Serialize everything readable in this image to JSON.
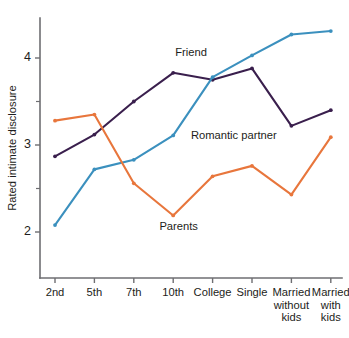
{
  "chart_data": {
    "type": "line",
    "title": "",
    "xlabel": "",
    "ylabel": "Rated intimate disclosure",
    "categories": [
      "2nd",
      "5th",
      "7th",
      "10th",
      "College",
      "Single",
      "Married without kids",
      "Married with kids"
    ],
    "category_lines": [
      [
        "2nd"
      ],
      [
        "5th"
      ],
      [
        "7th"
      ],
      [
        "10th"
      ],
      [
        "College"
      ],
      [
        "Single"
      ],
      [
        "Married",
        "without",
        "kids"
      ],
      [
        "Married",
        "with",
        "kids"
      ]
    ],
    "ylim": [
      1.5,
      4.6
    ],
    "yticks": [
      2,
      3,
      4
    ],
    "ytick_labels": [
      "2",
      "3",
      "4"
    ],
    "yminor_ticks": [
      2.5,
      3.5,
      4.5
    ],
    "grid": false,
    "legend_position": "inline-annotations",
    "series": [
      {
        "name": "Friend",
        "color": "#3a1f4d",
        "values": [
          2.87,
          3.12,
          3.5,
          3.83,
          3.75,
          3.88,
          3.22,
          3.4
        ],
        "label_x_index": 3.05,
        "label_y": 4.02
      },
      {
        "name": "Romantic partner",
        "color": "#3b90be",
        "values": [
          2.08,
          2.72,
          2.83,
          3.11,
          3.78,
          4.03,
          4.27,
          4.31
        ],
        "label_x_index": 3.45,
        "label_y": 3.07
      },
      {
        "name": "Parents",
        "color": "#e8763c",
        "values": [
          3.28,
          3.35,
          2.56,
          2.19,
          2.64,
          2.76,
          2.43,
          3.09
        ],
        "label_x_index": 2.65,
        "label_y": 2.02
      }
    ]
  },
  "colors": {
    "friend": "#3a1f4d",
    "romantic_partner": "#3b90be",
    "parents": "#e8763c",
    "axis": "#6e6e72",
    "text": "#1d1d20",
    "background": "#ffffff"
  }
}
